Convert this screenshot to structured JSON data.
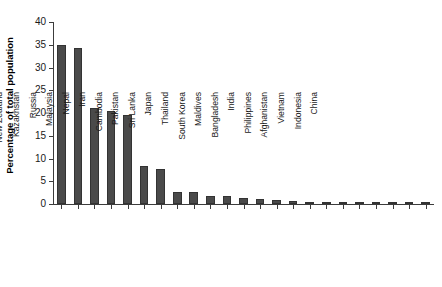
{
  "chart_data": {
    "type": "bar",
    "title": "",
    "subtitle": "",
    "xlabel": "",
    "ylabel": "Percentage of total population",
    "ylim": [
      0,
      40
    ],
    "yticks": [
      0,
      5,
      10,
      15,
      20,
      25,
      30,
      35,
      40
    ],
    "grid": false,
    "legend": null,
    "bar_color": "#4a4a4a",
    "axis_color": "#3c3c3c",
    "background": "#ffffff",
    "categories": [
      "Singapore",
      "Brunei",
      "Australia",
      "New Zealand",
      "Kazakhstan",
      "Russia",
      "Malaysia",
      "Nepal",
      "Iran",
      "Cambodia",
      "Pakistan",
      "Sri Lanka",
      "Japan",
      "Thailand",
      "South Korea",
      "Maldives",
      "Bangladesh",
      "India",
      "Philippines",
      "Afghanistan",
      "Vietnam",
      "Indonesia",
      "China"
    ],
    "values": [
      34.9,
      34.3,
      21.0,
      20.4,
      19.5,
      8.3,
      7.6,
      2.7,
      2.7,
      1.8,
      1.7,
      1.3,
      1.2,
      0.9,
      0.6,
      0.5,
      0.2,
      0.2,
      0.15,
      0.1,
      0.1,
      0.05,
      0.05
    ]
  }
}
